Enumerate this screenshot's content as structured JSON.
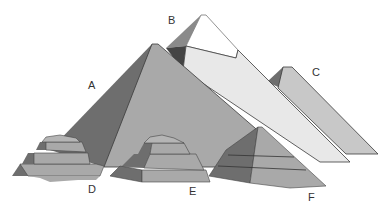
{
  "diagram": {
    "labels": {
      "A": "A",
      "B": "B",
      "C": "C",
      "D": "D",
      "E": "E",
      "F": "F"
    },
    "colors": {
      "light_face": "#a9a9a9",
      "dark_face": "#6e6e6e",
      "very_light_face": "#e6e6e6",
      "white_cap": "#ffffff",
      "outline": "#3a3a3a",
      "background": "#ffffff"
    }
  }
}
